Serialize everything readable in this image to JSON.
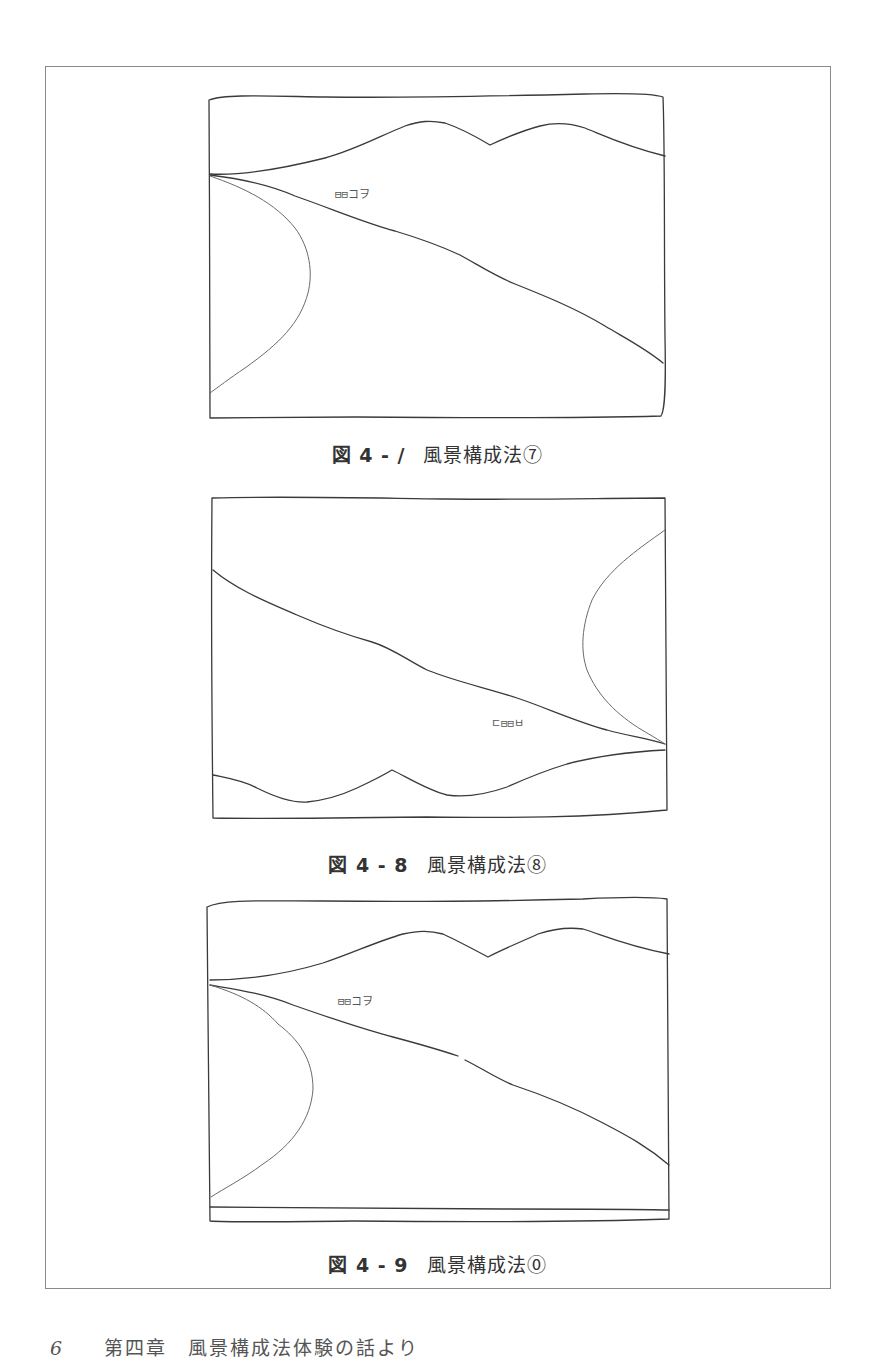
{
  "page": {
    "background": "#ffffff",
    "frame_color": "#8a8a8a",
    "line_color": "#3a3a3a"
  },
  "figures": [
    {
      "number": "図4-7",
      "number_display": "図 4 - /",
      "title": "風景構成法⑦",
      "house_mark": "⊟⊟コヲ"
    },
    {
      "number": "図4-8",
      "number_display": "図 4 - 8",
      "title": "風景構成法⑧",
      "house_mark": "ㄷ⊟⊟ㅂ"
    },
    {
      "number": "図4-9",
      "number_display": "図 4 - 9",
      "title": "風景構成法⓪",
      "house_mark": "⊟⊟コヲ"
    }
  ],
  "footer": {
    "page_number": "6",
    "running_head": "第四章　風景構成法体験の話より"
  }
}
